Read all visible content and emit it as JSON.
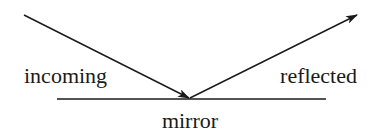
{
  "diagram": {
    "labels": {
      "incoming": "incoming",
      "reflected": "reflected",
      "mirror": "mirror"
    },
    "elements": [
      {
        "id": "incoming-ray",
        "type": "arrow",
        "direction": "toward mirror"
      },
      {
        "id": "reflected-ray",
        "type": "arrow",
        "direction": "away from mirror"
      },
      {
        "id": "mirror-surface",
        "type": "line"
      }
    ],
    "colors": {
      "stroke": "#1a1a1a",
      "background": "#ffffff"
    }
  }
}
